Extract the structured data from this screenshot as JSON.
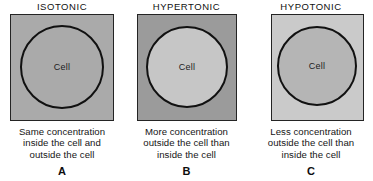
{
  "figure": {
    "background_color": "#ffffff"
  },
  "panels": [
    {
      "id": "panel-a",
      "title": "ISOTONIC",
      "cell_label": "Cell",
      "outside_color": "#aaaaaa",
      "inside_color": "#aaaaaa",
      "border_color": "#242424",
      "circle_stroke_color": "#111111",
      "caption_lines": [
        "Same concentration",
        "inside the cell and",
        "outside the cell"
      ],
      "letter": "A"
    },
    {
      "id": "panel-b",
      "title": "HYPERTONIC",
      "cell_label": "Cell",
      "outside_color": "#9b9b9b",
      "inside_color": "#c6c6c6",
      "border_color": "#242424",
      "circle_stroke_color": "#111111",
      "caption_lines": [
        "More concentration",
        "outside the cell than",
        "inside the cell"
      ],
      "letter": "B"
    },
    {
      "id": "panel-c",
      "title": "HYPOTONIC",
      "cell_label": "Cell",
      "outside_color": "#cacaca",
      "inside_color": "#b5b5b5",
      "border_color": "#242424",
      "circle_stroke_color": "#111111",
      "caption_lines": [
        "Less concentration",
        "outside the cell than",
        "inside the cell"
      ],
      "letter": "C"
    }
  ]
}
